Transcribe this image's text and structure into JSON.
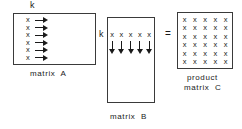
{
  "figure": {
    "background_color": "#ffffff",
    "ink_color": "#1a1a1a",
    "border_color": "#3a3a3a"
  },
  "cell_glyph": "x",
  "operator": {
    "equals": "="
  },
  "matrix_a": {
    "caption": "matrix  A",
    "dim_label": "k",
    "dim_label_position": "top",
    "row_count": 6,
    "arrow_direction": "right",
    "rows": [
      {
        "glyph": "x",
        "arrow": "→"
      },
      {
        "glyph": "x",
        "arrow": "→"
      },
      {
        "glyph": "x",
        "arrow": "→"
      },
      {
        "glyph": "x",
        "arrow": "→"
      },
      {
        "glyph": "x",
        "arrow": "→"
      },
      {
        "glyph": "x",
        "arrow": "→"
      }
    ]
  },
  "matrix_b": {
    "caption": "matrix  B",
    "dim_label": "k",
    "dim_label_position": "left",
    "column_count": 5,
    "arrow_direction": "down",
    "cells": [
      "x",
      "x",
      "x",
      "x",
      "x"
    ],
    "arrows": [
      "↓",
      "↓",
      "↓",
      "↓",
      "↓"
    ]
  },
  "matrix_c": {
    "caption_line1": "product",
    "caption_line2": "matrix  C",
    "row_count": 6,
    "column_count": 5,
    "grid": [
      [
        "x",
        "x",
        "x",
        "x",
        "x"
      ],
      [
        "x",
        "x",
        "x",
        "x",
        "x"
      ],
      [
        "x",
        "x",
        "x",
        "x",
        "x"
      ],
      [
        "x",
        "x",
        "x",
        "x",
        "x"
      ],
      [
        "x",
        "x",
        "x",
        "x",
        "x"
      ],
      [
        "x",
        "x",
        "x",
        "x",
        "x"
      ]
    ]
  }
}
